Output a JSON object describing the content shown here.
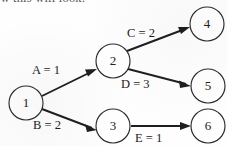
{
  "caption": {
    "text": "ow this will look:"
  },
  "diagram": {
    "colors": {
      "node_stroke": "#2b2b2b",
      "node_fill": "#ffffff",
      "edge": "#1f1f1f",
      "text": "#1c1c1c",
      "background": "#fefefe"
    },
    "nodes": [
      {
        "id": "1",
        "label": "1",
        "cx": 26,
        "cy": 103,
        "r": 17
      },
      {
        "id": "2",
        "label": "2",
        "cx": 113,
        "cy": 61,
        "r": 17
      },
      {
        "id": "3",
        "label": "3",
        "cx": 113,
        "cy": 126,
        "r": 17
      },
      {
        "id": "4",
        "label": "4",
        "cx": 207,
        "cy": 24,
        "r": 17
      },
      {
        "id": "5",
        "label": "5",
        "cx": 208,
        "cy": 86,
        "r": 17
      },
      {
        "id": "6",
        "label": "6",
        "cx": 208,
        "cy": 126,
        "r": 17
      }
    ],
    "edges": [
      {
        "id": "A",
        "from": "1",
        "to": "2",
        "label": "A = 1",
        "weight": 1,
        "label_x": 32,
        "label_y": 71
      },
      {
        "id": "B",
        "from": "1",
        "to": "3",
        "label": "B = 2",
        "weight": 2,
        "label_x": 33,
        "label_y": 126
      },
      {
        "id": "C",
        "from": "2",
        "to": "4",
        "label": "C = 2",
        "weight": 2,
        "label_x": 127,
        "label_y": 34
      },
      {
        "id": "D",
        "from": "2",
        "to": "5",
        "label": "D = 3",
        "weight": 3,
        "label_x": 121,
        "label_y": 85
      },
      {
        "id": "E",
        "from": "3",
        "to": "6",
        "label": "E = 1",
        "weight": 1,
        "label_x": 135,
        "label_y": 139
      }
    ]
  }
}
